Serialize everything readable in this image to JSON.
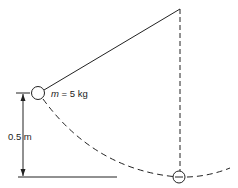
{
  "diagram": {
    "type": "pendulum",
    "mass_label": {
      "symbol": "m",
      "rest": " = 5 kg"
    },
    "height_label": "0.5 m",
    "colors": {
      "stroke": "#222222",
      "background": "#ffffff"
    }
  }
}
